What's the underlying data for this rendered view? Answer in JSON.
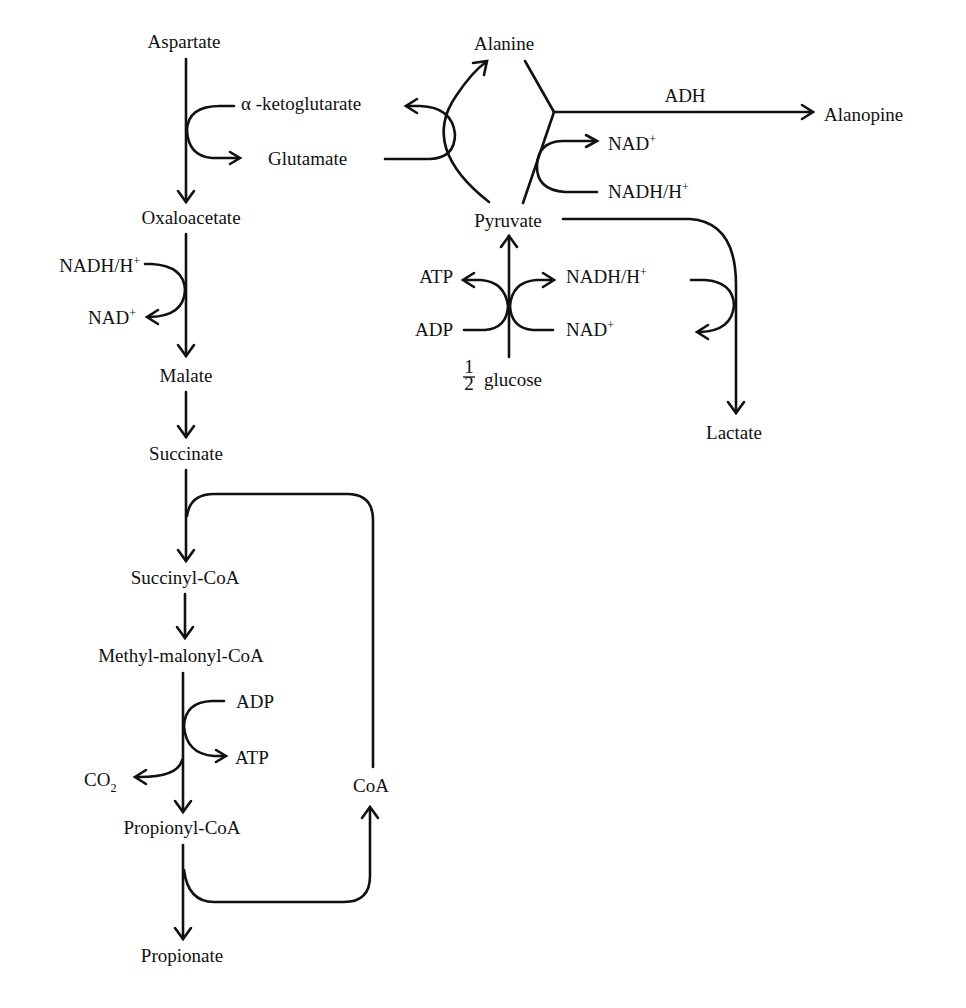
{
  "diagram": {
    "type": "metabolic-pathway",
    "colors": {
      "background": "#ffffff",
      "ink": "#111111"
    },
    "metabolites": {
      "aspartate": "Aspartate",
      "alpha_ketoglutarate": "α -ketoglutarate",
      "glutamate": "Glutamate",
      "oxaloacetate": "Oxaloacetate",
      "malate": "Malate",
      "succinate": "Succinate",
      "succinyl_coa": "Succinyl-CoA",
      "methylmalonyl_coa": "Methyl-malonyl-CoA",
      "propionyl_coa": "Propionyl-CoA",
      "propionate": "Propionate",
      "alanine": "Alanine",
      "alanopine": "Alanopine",
      "pyruvate": "Pyruvate",
      "lactate": "Lactate",
      "glucose_fraction_num": "1",
      "glucose_fraction_den": "2",
      "glucose": "glucose"
    },
    "enzymes": {
      "adh": "ADH"
    },
    "cofactors": {
      "alanopine_nad_base": "NAD",
      "alanopine_nad_sup": "+",
      "alanopine_nadh_base": "NADH/H",
      "alanopine_nadh_sup": "+",
      "oxalo_nadh_base": "NADH/H",
      "oxalo_nadh_sup": "+",
      "oxalo_nad_base": "NAD",
      "oxalo_nad_sup": "+",
      "glycolysis_atp": "ATP",
      "glycolysis_adp": "ADP",
      "glycolysis_nadh_base": "NADH/H",
      "glycolysis_nadh_sup": "+",
      "glycolysis_nad_base": "NAD",
      "glycolysis_nad_sup": "+",
      "mmcoa_adp": "ADP",
      "mmcoa_atp": "ATP",
      "co2_base": "CO",
      "co2_sub": "2",
      "coa": "CoA"
    },
    "reactions": [
      {
        "from": "Aspartate",
        "to": "Oxaloacetate",
        "coupled": "α-ketoglutarate → Glutamate"
      },
      {
        "from": "Glutamate",
        "to": "α-ketoglutarate",
        "coupled": "Pyruvate → Alanine"
      },
      {
        "from": "Alanine + Pyruvate",
        "to": "Alanopine",
        "enzyme": "ADH",
        "coupled": "NADH/H+ → NAD+"
      },
      {
        "from": "1/2 glucose",
        "to": "Pyruvate",
        "coupled": "ADP → ATP; NAD+ → NADH/H+"
      },
      {
        "from": "Pyruvate",
        "to": "Lactate",
        "coupled": "NADH/H+ → NAD+"
      },
      {
        "from": "Oxaloacetate",
        "to": "Malate",
        "coupled": "NADH/H+ → NAD+"
      },
      {
        "from": "Malate",
        "to": "Succinate"
      },
      {
        "from": "Succinate",
        "to": "Succinyl-CoA",
        "coupled": "CoA from Propionyl-CoA"
      },
      {
        "from": "Succinyl-CoA",
        "to": "Methyl-malonyl-CoA"
      },
      {
        "from": "Methyl-malonyl-CoA",
        "to": "Propionyl-CoA",
        "coupled": "ADP → ATP; releases CO2"
      },
      {
        "from": "Propionyl-CoA",
        "to": "Propionate",
        "coupled": "releases CoA"
      }
    ]
  }
}
